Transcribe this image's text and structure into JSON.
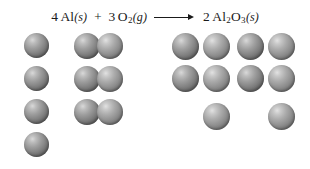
{
  "diagram": {
    "background_color": "#ffffff",
    "sphere_color_dark": "#6a6a6a",
    "sphere_color_light": "#909090"
  },
  "equation": {
    "reactant1": {
      "coefficient": "4",
      "formula": "Al",
      "state": "(s)",
      "name": "aluminum"
    },
    "operator_plus": "+",
    "reactant2": {
      "coefficient": "3",
      "formula_main": "O",
      "formula_sub": "2",
      "state": "(g)",
      "name": "oxygen"
    },
    "arrow": "⟶",
    "product": {
      "coefficient": "2",
      "formula_el1": "Al",
      "formula_sub1": "2",
      "formula_el2": "O",
      "formula_sub2": "3",
      "state": "(s)",
      "name": "aluminum oxide"
    }
  },
  "models": {
    "reactant_al": {
      "label": "4 aluminum atoms",
      "count": 4,
      "spheres": [
        {
          "x": 24,
          "y": 33,
          "d": 25,
          "shade": "dark"
        },
        {
          "x": 24,
          "y": 66,
          "d": 25,
          "shade": "dark"
        },
        {
          "x": 24,
          "y": 99,
          "d": 25,
          "shade": "dark"
        },
        {
          "x": 24,
          "y": 132,
          "d": 25,
          "shade": "dark"
        }
      ]
    },
    "reactant_o2": {
      "label": "3 oxygen molecules",
      "count": 3,
      "spheres": [
        {
          "x": 74,
          "y": 33,
          "d": 26,
          "shade": "dark"
        },
        {
          "x": 97,
          "y": 33,
          "d": 26,
          "shade": "light"
        },
        {
          "x": 74,
          "y": 66,
          "d": 26,
          "shade": "dark"
        },
        {
          "x": 97,
          "y": 66,
          "d": 26,
          "shade": "light"
        },
        {
          "x": 74,
          "y": 99,
          "d": 26,
          "shade": "dark"
        },
        {
          "x": 97,
          "y": 99,
          "d": 26,
          "shade": "light"
        }
      ]
    },
    "product_al2o3": {
      "label": "2 aluminum oxide formula units",
      "count": 2,
      "spheres": [
        {
          "x": 172,
          "y": 33,
          "d": 27,
          "shade": "dark"
        },
        {
          "x": 203,
          "y": 33,
          "d": 27,
          "shade": "light"
        },
        {
          "x": 172,
          "y": 65,
          "d": 27,
          "shade": "dark"
        },
        {
          "x": 203,
          "y": 65,
          "d": 27,
          "shade": "light"
        },
        {
          "x": 203,
          "y": 103,
          "d": 27,
          "shade": "light"
        },
        {
          "x": 237,
          "y": 33,
          "d": 27,
          "shade": "dark"
        },
        {
          "x": 268,
          "y": 33,
          "d": 27,
          "shade": "light"
        },
        {
          "x": 237,
          "y": 65,
          "d": 27,
          "shade": "dark"
        },
        {
          "x": 268,
          "y": 65,
          "d": 27,
          "shade": "light"
        },
        {
          "x": 268,
          "y": 103,
          "d": 27,
          "shade": "light"
        }
      ]
    }
  }
}
